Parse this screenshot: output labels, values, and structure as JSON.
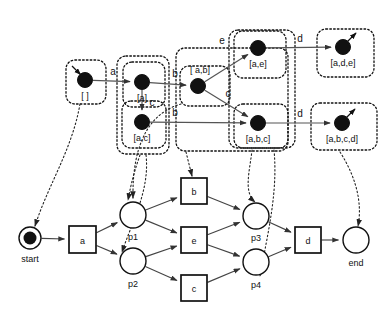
{
  "figure": {
    "colors": {
      "stroke": "#111111",
      "node_fill": "#111111",
      "arc": "#555555",
      "dashed_box": "#111111",
      "dotted_link": "#222222",
      "background": "#ffffff"
    }
  },
  "reachability_graph": {
    "states": [
      {
        "id": "s0",
        "label": "[ ]",
        "x": 85,
        "y": 80,
        "label_x": 85,
        "label_y": 99,
        "initial": true,
        "final": false
      },
      {
        "id": "s1",
        "label": "[a]",
        "x": 142,
        "y": 82,
        "label_x": 142,
        "label_y": 101,
        "initial": false,
        "final": false
      },
      {
        "id": "s2",
        "label": "[a,c]",
        "x": 142,
        "y": 122,
        "label_x": 142,
        "label_y": 141,
        "initial": false,
        "final": false
      },
      {
        "id": "s3",
        "label": "[ a,b]",
        "x": 198,
        "y": 86,
        "label_x": 200,
        "label_y": 73,
        "initial": false,
        "final": false
      },
      {
        "id": "s4",
        "label": "[a,e]",
        "x": 258,
        "y": 48,
        "label_x": 258,
        "label_y": 67,
        "initial": false,
        "final": false
      },
      {
        "id": "s5",
        "label": "[a,b,c]",
        "x": 258,
        "y": 123,
        "label_x": 258,
        "label_y": 142,
        "initial": false,
        "final": false
      },
      {
        "id": "s6",
        "label": "[a,d,e]",
        "x": 343,
        "y": 47,
        "label_x": 343,
        "label_y": 66,
        "initial": false,
        "final": true
      },
      {
        "id": "s7",
        "label": "[a,b,c,d]",
        "x": 342,
        "y": 123,
        "label_x": 342,
        "label_y": 142,
        "initial": false,
        "final": true
      }
    ],
    "transitions": [
      {
        "from": "s0",
        "to": "s1",
        "label": "a",
        "label_x": 113,
        "label_y": 75
      },
      {
        "from": "s1",
        "to": "s3",
        "label": "b",
        "label_x": 175,
        "label_y": 77
      },
      {
        "from": "s1",
        "to": "s2",
        "label": "c",
        "label_x": 152,
        "label_y": 106
      },
      {
        "from": "s2",
        "to": "s5",
        "label": "b",
        "label_x": 175,
        "label_y": 116
      },
      {
        "from": "s3",
        "to": "s4",
        "label": "e",
        "label_x": 222,
        "label_y": 44
      },
      {
        "from": "s3",
        "to": "s5",
        "label": "c",
        "label_x": 228,
        "label_y": 97
      },
      {
        "from": "s4",
        "to": "s6",
        "label": "d",
        "label_x": 300,
        "label_y": 42
      },
      {
        "from": "s5",
        "to": "s7",
        "label": "d",
        "label_x": 300,
        "label_y": 117
      }
    ],
    "regions": [
      {
        "id": "r-empty",
        "x": 66,
        "y": 60,
        "w": 40,
        "h": 44
      },
      {
        "id": "r-a-all",
        "x": 117,
        "y": 56,
        "w": 52,
        "h": 98
      },
      {
        "id": "r-a",
        "x": 123,
        "y": 62,
        "w": 42,
        "h": 45
      },
      {
        "id": "r-ac",
        "x": 122,
        "y": 101,
        "w": 44,
        "h": 47
      },
      {
        "id": "r-b-all",
        "x": 176,
        "y": 48,
        "w": 112,
        "h": 103
      },
      {
        "id": "r-ab",
        "x": 180,
        "y": 66,
        "w": 50,
        "h": 40
      },
      {
        "id": "r-e-col",
        "x": 229,
        "y": 30,
        "w": 66,
        "h": 118
      },
      {
        "id": "r-ae",
        "x": 234,
        "y": 31,
        "w": 52,
        "h": 47
      },
      {
        "id": "r-abc",
        "x": 234,
        "y": 104,
        "w": 54,
        "h": 44
      },
      {
        "id": "r-ade",
        "x": 317,
        "y": 29,
        "w": 57,
        "h": 48
      },
      {
        "id": "r-abcd",
        "x": 311,
        "y": 103,
        "w": 66,
        "h": 47
      }
    ]
  },
  "petri_net": {
    "places": [
      {
        "id": "start",
        "label": "start",
        "x": 30,
        "y": 238,
        "r": 11,
        "token": true,
        "label_x": 30,
        "label_y": 262
      },
      {
        "id": "p1",
        "label": "p1",
        "x": 133,
        "y": 215,
        "r": 13,
        "token": false,
        "label_x": 133,
        "label_y": 240
      },
      {
        "id": "p2",
        "label": "p2",
        "x": 133,
        "y": 261,
        "r": 13,
        "token": false,
        "label_x": 133,
        "label_y": 287
      },
      {
        "id": "p3",
        "label": "p3",
        "x": 256,
        "y": 216,
        "r": 13,
        "token": false,
        "label_x": 256,
        "label_y": 241
      },
      {
        "id": "p4",
        "label": "p4",
        "x": 256,
        "y": 262,
        "r": 13,
        "token": false,
        "label_x": 256,
        "label_y": 288
      },
      {
        "id": "end",
        "label": "end",
        "x": 356,
        "y": 240,
        "r": 13,
        "token": false,
        "label_x": 356,
        "label_y": 266
      }
    ],
    "transitions": [
      {
        "id": "t_a",
        "label": "a",
        "x": 69,
        "y": 226,
        "w": 27,
        "h": 27
      },
      {
        "id": "t_b",
        "label": "b",
        "x": 181,
        "y": 178,
        "w": 26,
        "h": 26
      },
      {
        "id": "t_e",
        "label": "e",
        "x": 181,
        "y": 227,
        "w": 26,
        "h": 26
      },
      {
        "id": "t_c",
        "label": "c",
        "x": 181,
        "y": 275,
        "w": 26,
        "h": 26
      },
      {
        "id": "t_d",
        "label": "d",
        "x": 295,
        "y": 227,
        "w": 26,
        "h": 26
      }
    ],
    "arcs": [
      {
        "from": "start",
        "to": "t_a"
      },
      {
        "from": "t_a",
        "to": "p1"
      },
      {
        "from": "t_a",
        "to": "p2"
      },
      {
        "from": "p1",
        "to": "t_b"
      },
      {
        "from": "p1",
        "to": "t_e"
      },
      {
        "from": "p2",
        "to": "t_e"
      },
      {
        "from": "p2",
        "to": "t_c"
      },
      {
        "from": "t_b",
        "to": "p3"
      },
      {
        "from": "t_e",
        "to": "p3"
      },
      {
        "from": "t_e",
        "to": "p4"
      },
      {
        "from": "t_c",
        "to": "p4"
      },
      {
        "from": "p3",
        "to": "t_d"
      },
      {
        "from": "p4",
        "to": "t_d"
      },
      {
        "from": "t_d",
        "to": "end"
      }
    ]
  },
  "mapping_links": [
    {
      "id": "link-empty-start",
      "d": "M 80 104 C 72 150 48 185 35 226"
    },
    {
      "id": "link-a-p1",
      "d": "M 140 155 C 132 178 130 190 128 200"
    },
    {
      "id": "link-a-p2",
      "d": "M 146 155 C 150 190 132 222 122 252"
    },
    {
      "id": "link-ab-p1p3",
      "d": "M 181 104 C 152 112 132 140 133 198"
    },
    {
      "id": "link-b-top",
      "d": "M 186 152 C 188 160 190 168 192 176"
    },
    {
      "id": "link-abc-p3",
      "d": "M 252 150 C 250 170 243 192 255 202"
    },
    {
      "id": "link-ecol-p4",
      "d": "M 274 150 C 278 192 268 232 260 276"
    },
    {
      "id": "link-abcd-end",
      "d": "M 340 152 C 358 180 362 206 358 226"
    }
  ]
}
